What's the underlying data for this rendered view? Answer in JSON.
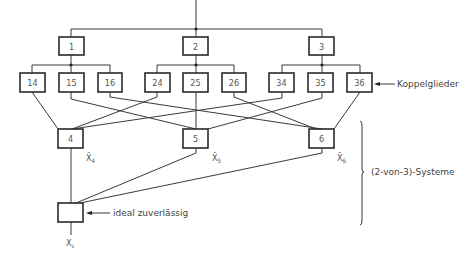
{
  "diagram": {
    "top_boxes": [
      {
        "id": "1",
        "label": "1"
      },
      {
        "id": "2",
        "label": "2"
      },
      {
        "id": "3",
        "label": "3"
      }
    ],
    "coupler_boxes": [
      {
        "label": "14"
      },
      {
        "label": "15"
      },
      {
        "label": "16"
      },
      {
        "label": "24"
      },
      {
        "label": "25"
      },
      {
        "label": "26"
      },
      {
        "label": "34"
      },
      {
        "label": "35"
      },
      {
        "label": "36"
      }
    ],
    "voter_boxes": [
      {
        "label": "4",
        "output": "X̃",
        "output_sub": "4"
      },
      {
        "label": "5",
        "output": "X̃",
        "output_sub": "5"
      },
      {
        "label": "6",
        "output": "X̃",
        "output_sub": "6"
      }
    ],
    "final_box": {
      "label": "",
      "output": "X",
      "output_sub": "s"
    },
    "annotations": {
      "couplers": "Koppelglieder",
      "two_of_three": "(2-von-3)-Systeme",
      "ideal": "ideal zuverlässig"
    }
  }
}
